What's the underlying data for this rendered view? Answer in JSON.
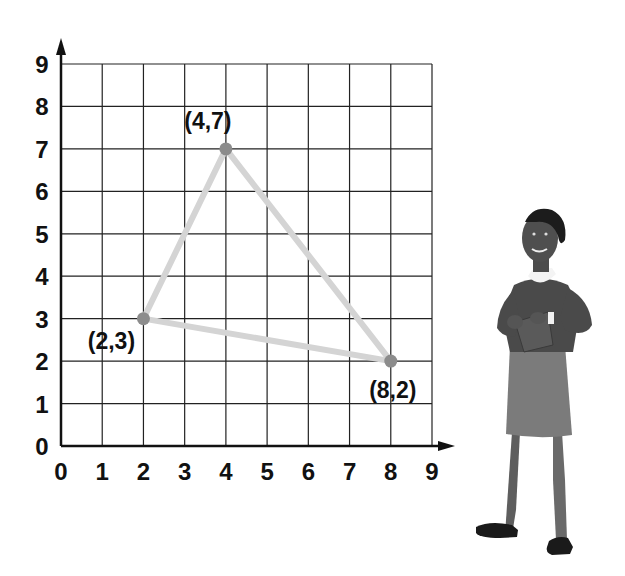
{
  "figure": {
    "type": "coordinate-grid-triangle",
    "x_axis_ticks": [
      "0",
      "1",
      "2",
      "3",
      "4",
      "5",
      "6",
      "7",
      "8",
      "9"
    ],
    "y_axis_ticks": [
      "0",
      "1",
      "2",
      "3",
      "4",
      "5",
      "6",
      "7",
      "8",
      "9"
    ],
    "points": [
      {
        "x": 4,
        "y": 7,
        "label": "(4,7)"
      },
      {
        "x": 2,
        "y": 3,
        "label": "(2,3)"
      },
      {
        "x": 8,
        "y": 2,
        "label": "(8,2)"
      }
    ],
    "colors": {
      "grid": "#222222",
      "triangle_edge": "#d4d4d4",
      "vertex": "#8c8c8c"
    }
  },
  "illustration": {
    "subject": "woman-writing-on-clipboard"
  }
}
